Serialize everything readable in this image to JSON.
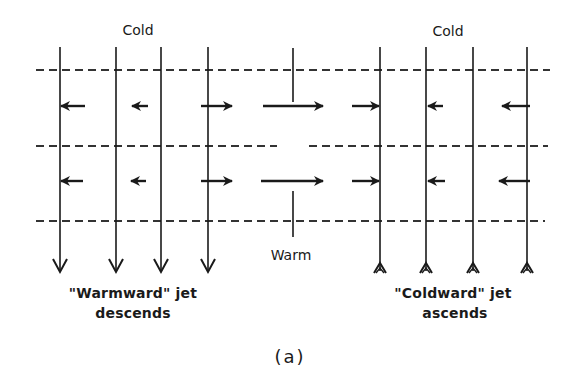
{
  "figure": {
    "caption": "(a)",
    "labels": {
      "cold_left": "Cold",
      "cold_right": "Cold",
      "warm": "Warm",
      "warmward_line1": "\"Warmward\" jet",
      "warmward_line2": "descends",
      "coldward_line1": "\"Coldward\" jet",
      "coldward_line2": "ascends"
    },
    "colors": {
      "ink": "#1a1a1a",
      "dash": "#333333",
      "background": "#ffffff"
    },
    "layers": {
      "dashed_lines": [
        {
          "name": "upper-level",
          "y": 70,
          "segments": [
            [
              36,
              550
            ]
          ]
        },
        {
          "name": "mid-level",
          "y": 146,
          "segments": [
            [
              36,
              277
            ],
            [
              309,
              548
            ]
          ]
        },
        {
          "name": "lower-level",
          "y": 221,
          "segments": [
            [
              36,
              545
            ]
          ]
        }
      ]
    },
    "vertical_motion_lines": {
      "descending_left": {
        "x": [
          60,
          116,
          161,
          208
        ],
        "y_top": 47,
        "y_bottom": 272,
        "direction": "down"
      },
      "ascending_right": {
        "x": [
          380,
          426,
          473,
          527
        ],
        "y_top": 47,
        "y_bottom": 273,
        "direction": "up"
      }
    },
    "horizontal_flow_arrows": {
      "upper_row": {
        "y": 106,
        "arrows": [
          {
            "from": 85,
            "to": 61,
            "direction": "left"
          },
          {
            "from": 148,
            "to": 132,
            "direction": "left"
          },
          {
            "from": 201,
            "to": 232,
            "direction": "right"
          },
          {
            "from": 263,
            "to": 323,
            "direction": "right"
          },
          {
            "from": 352,
            "to": 379,
            "direction": "right"
          },
          {
            "from": 443,
            "to": 428,
            "direction": "left"
          },
          {
            "from": 530,
            "to": 502,
            "direction": "left"
          }
        ]
      },
      "lower_row": {
        "y": 181,
        "arrows": [
          {
            "from": 83,
            "to": 61,
            "direction": "left"
          },
          {
            "from": 146,
            "to": 131,
            "direction": "left"
          },
          {
            "from": 201,
            "to": 232,
            "direction": "right"
          },
          {
            "from": 261,
            "to": 323,
            "direction": "right"
          },
          {
            "from": 352,
            "to": 379,
            "direction": "right"
          },
          {
            "from": 445,
            "to": 428,
            "direction": "left"
          },
          {
            "from": 530,
            "to": 499,
            "direction": "left"
          }
        ]
      }
    },
    "center_ticks": {
      "x": 293,
      "top": {
        "y1": 48,
        "y2": 102
      },
      "bottom": {
        "y1": 191,
        "y2": 237
      }
    }
  }
}
